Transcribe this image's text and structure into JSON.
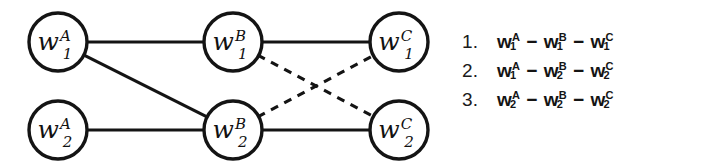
{
  "figure": {
    "background_color": "#ffffff",
    "ink_color": "#141414"
  },
  "graph": {
    "nodes": [
      {
        "id": "A1",
        "base": "w",
        "sup": "A",
        "sub": "1",
        "cx": 58,
        "cy": 42,
        "r": 29
      },
      {
        "id": "A2",
        "base": "w",
        "sup": "A",
        "sub": "2",
        "cx": 58,
        "cy": 130,
        "r": 29
      },
      {
        "id": "B1",
        "base": "w",
        "sup": "B",
        "sub": "1",
        "cx": 233,
        "cy": 42,
        "r": 29
      },
      {
        "id": "B2",
        "base": "w",
        "sup": "B",
        "sub": "2",
        "cx": 233,
        "cy": 130,
        "r": 29
      },
      {
        "id": "C1",
        "base": "w",
        "sup": "C",
        "sub": "1",
        "cx": 399,
        "cy": 42,
        "r": 29
      },
      {
        "id": "C2",
        "base": "w",
        "sup": "C",
        "sub": "2",
        "cx": 399,
        "cy": 130,
        "r": 29
      }
    ],
    "edges": [
      {
        "id": "A1-B1",
        "from": "A1",
        "to": "B1",
        "style": "solid"
      },
      {
        "id": "A1-B2",
        "from": "A1",
        "to": "B2",
        "style": "solid"
      },
      {
        "id": "A2-B2",
        "from": "A2",
        "to": "B2",
        "style": "solid"
      },
      {
        "id": "B1-C1",
        "from": "B1",
        "to": "C1",
        "style": "solid"
      },
      {
        "id": "B2-C2",
        "from": "B2",
        "to": "C2",
        "style": "solid"
      },
      {
        "id": "B1-C2",
        "from": "B1",
        "to": "C2",
        "style": "dashed"
      },
      {
        "id": "B2-C1",
        "from": "B2",
        "to": "C1",
        "style": "dashed"
      }
    ]
  },
  "path_list": {
    "items": [
      {
        "index": "1.",
        "terms": [
          {
            "base": "w",
            "sup": "A",
            "sub": "1"
          },
          {
            "base": "w",
            "sup": "B",
            "sub": "1"
          },
          {
            "base": "w",
            "sup": "C",
            "sub": "1"
          }
        ],
        "separator": "−",
        "text": "w₁ᴬ − w₁ᴮ − w₁ᶜ"
      },
      {
        "index": "2.",
        "terms": [
          {
            "base": "w",
            "sup": "A",
            "sub": "1"
          },
          {
            "base": "w",
            "sup": "B",
            "sub": "2"
          },
          {
            "base": "w",
            "sup": "C",
            "sub": "2"
          }
        ],
        "separator": "−",
        "text": "w₁ᴬ − w₂ᴮ − w₂ᶜ"
      },
      {
        "index": "3.",
        "terms": [
          {
            "base": "w",
            "sup": "A",
            "sub": "2"
          },
          {
            "base": "w",
            "sup": "B",
            "sub": "2"
          },
          {
            "base": "w",
            "sup": "C",
            "sub": "2"
          }
        ],
        "separator": "−",
        "text": "w₂ᴬ − w₂ᴮ − w₂ᶜ"
      }
    ]
  }
}
